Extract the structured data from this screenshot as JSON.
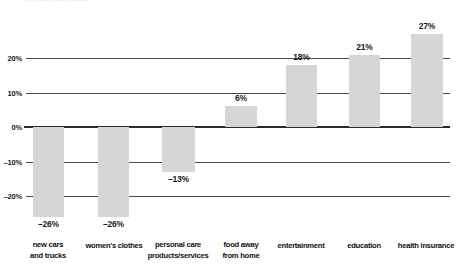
{
  "top_residue_text": "—  —   ——  ——",
  "chart_data": {
    "type": "bar",
    "title": "",
    "subtitle": "",
    "xlabel": "",
    "ylabel": "",
    "ylim": [
      -30,
      30
    ],
    "grid": true,
    "legend": null,
    "zero_baseline": true,
    "value_label_format": "percent",
    "categories": [
      "new cars\nand trucks",
      "women's clothes",
      "personal care\nproducts/services",
      "food away\nfrom home",
      "entertainment",
      "education",
      "health insurance"
    ],
    "values": [
      -26,
      -26,
      -13,
      6,
      18,
      21,
      27
    ],
    "value_labels": [
      "–26%",
      "–26%",
      "–13%",
      "6%",
      "18%",
      "21%",
      "27%"
    ],
    "yticks": [
      20,
      10,
      0,
      -10,
      -20
    ],
    "ytick_labels": [
      "20%",
      "10%",
      "0%",
      "–10%",
      "–20%"
    ],
    "colors": {
      "bar_fill": "#d6d6d6",
      "gridline": "#4a4a4a",
      "zero_line": "#2b2b2b",
      "text": "#1a1a1a",
      "background": "#ffffff"
    }
  }
}
